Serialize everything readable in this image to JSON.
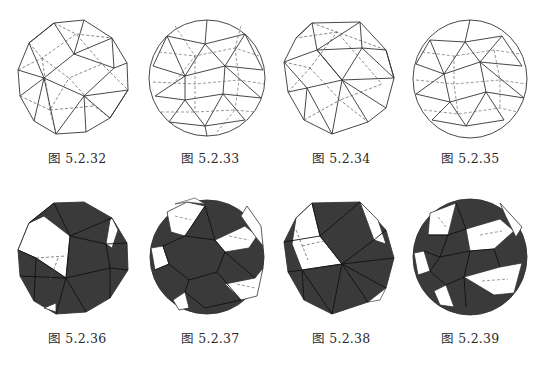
{
  "figures": [
    {
      "caption": "图 5.2.32",
      "style": "wireframe",
      "density": "low"
    },
    {
      "caption": "图 5.2.33",
      "style": "wireframe",
      "density": "high"
    },
    {
      "caption": "图 5.2.34",
      "style": "wireframe",
      "density": "low"
    },
    {
      "caption": "图 5.2.35",
      "style": "wireframe",
      "density": "high"
    },
    {
      "caption": "图 5.2.36",
      "style": "shaded",
      "density": "low"
    },
    {
      "caption": "图 5.2.37",
      "style": "shaded",
      "density": "high"
    },
    {
      "caption": "图 5.2.38",
      "style": "shaded",
      "density": "low"
    },
    {
      "caption": "图 5.2.39",
      "style": "shaded",
      "density": "high"
    }
  ],
  "colors": {
    "line": "#333333",
    "fill": "#3a3a3a",
    "background": "#ffffff"
  }
}
